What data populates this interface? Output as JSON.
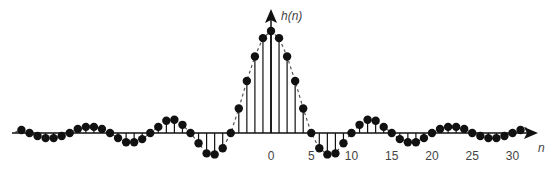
{
  "chart_data": {
    "type": "stem",
    "title": "",
    "xlabel": "n",
    "ylabel": "h(n)",
    "x_ticks": [
      0,
      5,
      10,
      15,
      20,
      25,
      30
    ],
    "x_tick_labels": [
      "0",
      "5",
      "10",
      "15",
      "20",
      "25",
      "30"
    ],
    "xlim": [
      -31,
      31
    ],
    "envelope": "dashed sinc-like curve",
    "grid": false,
    "legend": null,
    "n": [
      -31,
      -30,
      -29,
      -28,
      -27,
      -26,
      -25,
      -24,
      -23,
      -22,
      -21,
      -20,
      -19,
      -18,
      -17,
      -16,
      -15,
      -14,
      -13,
      -12,
      -11,
      -10,
      -9,
      -8,
      -7,
      -6,
      -5,
      -4,
      -3,
      -2,
      -1,
      0,
      1,
      2,
      3,
      4,
      5,
      6,
      7,
      8,
      9,
      10,
      11,
      12,
      13,
      14,
      15,
      16,
      17,
      18,
      19,
      20,
      21,
      22,
      23,
      24,
      25,
      26,
      27,
      28,
      29,
      30,
      31
    ],
    "values": [
      0.03,
      0,
      -0.03,
      -0.05,
      -0.05,
      -0.03,
      0,
      0.04,
      0.06,
      0.06,
      0.04,
      0,
      -0.05,
      -0.09,
      -0.09,
      -0.06,
      0,
      0.06,
      0.12,
      0.13,
      0.08,
      0,
      -0.1,
      -0.2,
      -0.21,
      -0.15,
      0,
      0.24,
      0.51,
      0.75,
      0.93,
      1.0,
      0.93,
      0.75,
      0.51,
      0.24,
      0,
      -0.15,
      -0.21,
      -0.2,
      -0.1,
      0,
      0.08,
      0.13,
      0.12,
      0.06,
      0,
      -0.06,
      -0.09,
      -0.09,
      -0.05,
      0,
      0.04,
      0.06,
      0.06,
      0.04,
      0,
      -0.03,
      -0.05,
      -0.05,
      -0.03,
      0,
      0.03
    ]
  },
  "labels": {
    "y_axis": "h(n)",
    "x_axis": "n"
  },
  "layout": {
    "origin_x": 271,
    "axis_y": 133,
    "px_per_sample": 8.05,
    "px_per_unit": 102
  }
}
